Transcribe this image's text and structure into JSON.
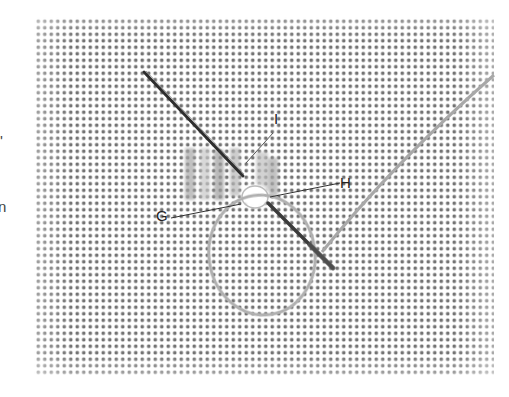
{
  "figure": {
    "type": "embroidery stitch illustration",
    "labels": [
      {
        "id": "G",
        "text": "G"
      },
      {
        "id": "H",
        "text": "H"
      },
      {
        "id": "I",
        "text": "I"
      }
    ],
    "clipped_left_text": {
      "glyph_1": "'",
      "glyph_2": "n"
    }
  },
  "colors": {
    "fabric_dot": "#5a5a5a",
    "needle": "#3a3a3a",
    "thread": "#b5b5b5",
    "stitches": "#9a9a9a",
    "leader_line": "#333333"
  }
}
